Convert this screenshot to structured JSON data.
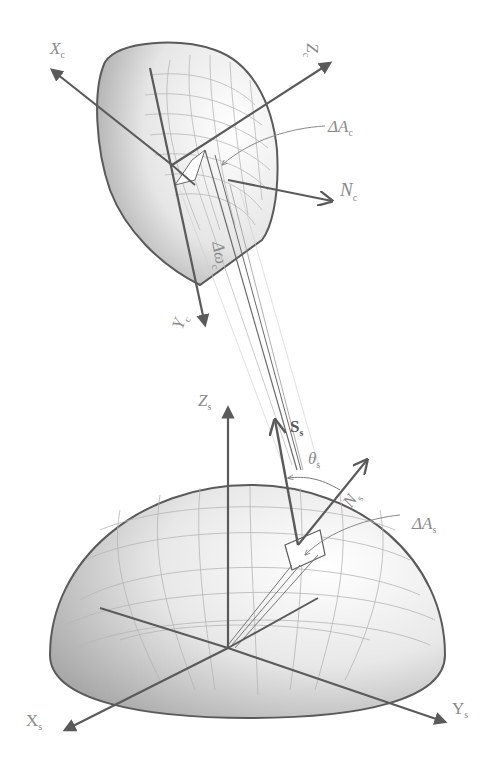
{
  "figure": {
    "collector": {
      "axis_x_label": "X",
      "axis_x_sub": "c",
      "axis_y_label": "Y",
      "axis_y_sub": "c",
      "axis_z_label": "Z",
      "axis_z_sub": "c",
      "normal_label": "N",
      "normal_sub": "c",
      "area_label": "ΔA",
      "area_sub": "c",
      "solid_angle_label": "Δω",
      "solid_angle_sub": "c"
    },
    "source": {
      "axis_x_label": "X",
      "axis_x_sub": "s",
      "axis_y_label": "Y",
      "axis_y_sub": "s",
      "axis_z_label": "Z",
      "axis_z_sub": "s",
      "normal_label": "N",
      "normal_sub": "s",
      "area_label": "ΔA",
      "area_sub": "s",
      "direction_label": "S",
      "direction_sub": "s",
      "angle_label": "θ",
      "angle_sub": "s"
    },
    "colors": {
      "line": "#5a5a5a",
      "label": "#8a8a8a",
      "shade_dark": "#9a9a9a",
      "shade_light": "#f2f2f2"
    }
  }
}
